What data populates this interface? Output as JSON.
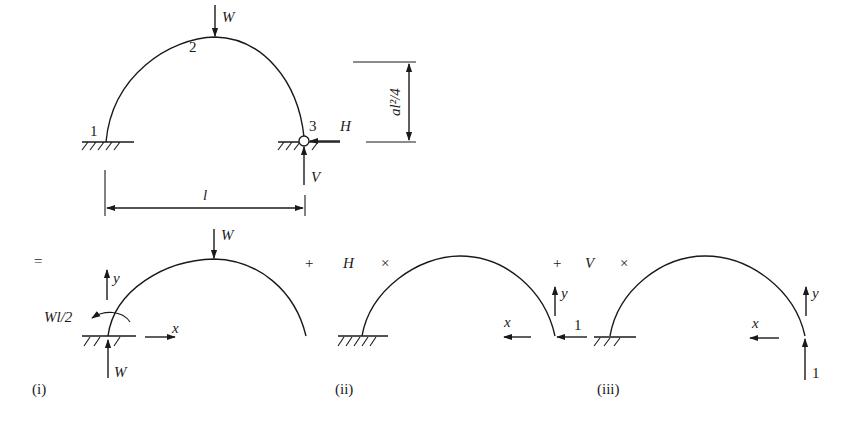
{
  "top_figure": {
    "node_labels": {
      "n1": "1",
      "n2": "2",
      "n3": "3"
    },
    "load_label": "W",
    "reaction_h_label": "H",
    "reaction_v_label": "V",
    "span_label": "l",
    "rise_label": "al²/4"
  },
  "equation": {
    "equals": "=",
    "plus_1": "+",
    "h_factor": "H",
    "times_1": "×",
    "plus_2": "+",
    "v_factor": "V",
    "times_2": "×"
  },
  "case_i": {
    "caption": "(i)",
    "load_label": "W",
    "moment_label": "Wl/2",
    "reaction_label": "W",
    "axis_x": "x",
    "axis_y": "y"
  },
  "case_ii": {
    "caption": "(ii)",
    "unit_load_label": "1",
    "axis_x": "x",
    "axis_y": "y"
  },
  "case_iii": {
    "caption": "(iii)",
    "unit_load_label": "1",
    "axis_x": "x",
    "axis_y": "y"
  }
}
